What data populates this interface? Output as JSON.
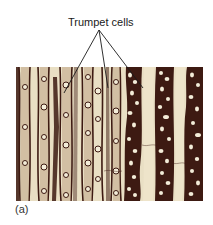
{
  "figure": {
    "callout": {
      "label": "Trumpet cells",
      "leader_origin": [
        99,
        30
      ],
      "leader_targets": [
        [
          64,
          93
        ],
        [
          108,
          88
        ],
        [
          143,
          88
        ]
      ]
    },
    "panel_label": "(a)",
    "micrograph": {
      "description": "Light micrograph of longitudinal section showing elongated cell files with dark walls and trumpet cells",
      "colors": {
        "background": "#e9dfc4",
        "dark_wall": "#3d1a12",
        "mid_tone": "#8a6a52",
        "highlight": "#f3ecd8"
      }
    }
  }
}
